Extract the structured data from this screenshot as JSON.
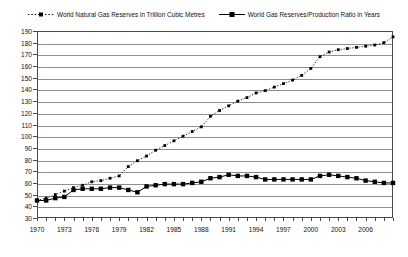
{
  "legend": {
    "entries": [
      {
        "label": "World Natural Gas Reserves in Trillion Cubic Metres",
        "key": "dotted-marker-key",
        "color": "#000000",
        "style": "dotted"
      },
      {
        "label": "World Gas Reserves/Production Ratio in Years",
        "key": "solid-marker-key",
        "color": "#000000",
        "style": "solid"
      }
    ]
  },
  "axes": {
    "y_ticks": [
      190,
      180,
      170,
      160,
      150,
      140,
      130,
      120,
      110,
      100,
      90,
      80,
      70,
      60,
      50,
      40,
      30
    ],
    "x_labels": [
      1970,
      1973,
      1976,
      1979,
      1982,
      1985,
      1988,
      1991,
      1994,
      1997,
      2000,
      2003,
      2006
    ]
  },
  "chart_data": {
    "type": "line",
    "title": "",
    "subtitle": "",
    "xlabel": "",
    "ylabel": "",
    "xlim": [
      1970,
      2009
    ],
    "ylim": [
      30,
      190
    ],
    "grid": true,
    "legend_position": "top",
    "x": [
      1970,
      1971,
      1972,
      1973,
      1974,
      1975,
      1976,
      1977,
      1978,
      1979,
      1980,
      1981,
      1982,
      1983,
      1984,
      1985,
      1986,
      1987,
      1988,
      1989,
      1990,
      1991,
      1992,
      1993,
      1994,
      1995,
      1996,
      1997,
      1998,
      1999,
      2000,
      2001,
      2002,
      2003,
      2004,
      2005,
      2006,
      2007,
      2008,
      2009
    ],
    "series": [
      {
        "name": "World Natural Gas Reserves in Trillion Cubic Metres",
        "units": "Trillion Cubic Metres",
        "style": "dotted",
        "marker": "small-square",
        "color": "#000000",
        "values": [
          45,
          47,
          50,
          53,
          56,
          58,
          61,
          62,
          64,
          66,
          74,
          79,
          83,
          88,
          92,
          96,
          100,
          104,
          108,
          117,
          122,
          126,
          130,
          133,
          137,
          139,
          142,
          145,
          148,
          152,
          158,
          168,
          172,
          174,
          175,
          176,
          177,
          178,
          180,
          185
        ]
      },
      {
        "name": "World Gas Reserves/Production Ratio in Years",
        "units": "Years",
        "style": "solid",
        "marker": "large-square",
        "color": "#000000",
        "values": [
          45,
          45,
          47,
          48,
          54,
          55,
          55,
          55,
          56,
          56,
          54,
          52,
          57,
          58,
          59,
          59,
          59,
          60,
          61,
          64,
          65,
          67,
          66,
          66,
          65,
          63,
          63,
          63,
          63,
          63,
          63,
          66,
          67,
          66,
          65,
          64,
          62,
          61,
          60,
          60
        ]
      }
    ]
  }
}
